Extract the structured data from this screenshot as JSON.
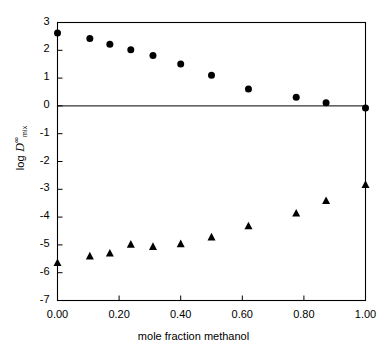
{
  "chart_data": {
    "type": "scatter",
    "title": "",
    "xlabel": "mole fraction methanol",
    "ylabel": "log D∞mix",
    "ylabel_parts": {
      "prefix": "log ",
      "symbol": "D",
      "superscript": "∞",
      "subscript": "mix"
    },
    "xlim": [
      0.0,
      1.0
    ],
    "ylim": [
      -7,
      3
    ],
    "xticks": [
      0.0,
      0.2,
      0.4,
      0.6,
      0.8,
      1.0
    ],
    "xtick_labels": [
      "0.00",
      "0.20",
      "0.40",
      "0.60",
      "0.80",
      "1.00"
    ],
    "yticks": [
      3,
      2,
      1,
      0,
      -1,
      -2,
      -3,
      -4,
      -5,
      -6,
      -7
    ],
    "ytick_labels": [
      "3",
      "2",
      "1",
      "0",
      "-1",
      "-2",
      "-3",
      "-4",
      "-5",
      "-6",
      "-7"
    ],
    "grid": false,
    "legend": "none",
    "reference_lines": [
      {
        "axis": "y",
        "value": 0,
        "color": "#000000"
      }
    ],
    "frame_color": "#000000",
    "background": "#ffffff",
    "series": [
      {
        "name": "circles",
        "marker": "circle",
        "color": "#000000",
        "marker_size": 7,
        "points": [
          {
            "x": 0.0,
            "y": 2.62
          },
          {
            "x": 0.105,
            "y": 2.42
          },
          {
            "x": 0.17,
            "y": 2.22
          },
          {
            "x": 0.238,
            "y": 2.02
          },
          {
            "x": 0.31,
            "y": 1.81
          },
          {
            "x": 0.4,
            "y": 1.51
          },
          {
            "x": 0.5,
            "y": 1.1
          },
          {
            "x": 0.62,
            "y": 0.61
          },
          {
            "x": 0.775,
            "y": 0.31
          },
          {
            "x": 0.872,
            "y": 0.11
          },
          {
            "x": 1.0,
            "y": -0.08
          }
        ]
      },
      {
        "name": "triangles",
        "marker": "triangle",
        "color": "#000000",
        "marker_size": 8,
        "points": [
          {
            "x": 0.0,
            "y": -5.65
          },
          {
            "x": 0.105,
            "y": -5.41
          },
          {
            "x": 0.17,
            "y": -5.31
          },
          {
            "x": 0.238,
            "y": -4.99
          },
          {
            "x": 0.31,
            "y": -5.07
          },
          {
            "x": 0.4,
            "y": -4.97
          },
          {
            "x": 0.5,
            "y": -4.73
          },
          {
            "x": 0.62,
            "y": -4.33
          },
          {
            "x": 0.775,
            "y": -3.87
          },
          {
            "x": 0.872,
            "y": -3.42
          },
          {
            "x": 1.0,
            "y": -2.84
          }
        ]
      }
    ]
  }
}
